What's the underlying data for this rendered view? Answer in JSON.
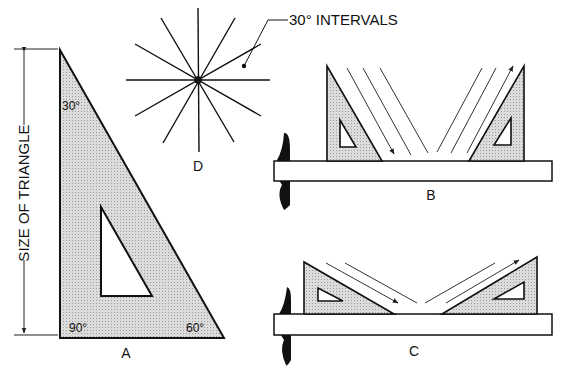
{
  "figure": {
    "labels": {
      "size_of_triangle": "SIZE OF TRIANGLE",
      "angle_30": "30°",
      "angle_90": "90°",
      "angle_60": "60°",
      "panel_a": "A",
      "panel_b": "B",
      "panel_c": "C",
      "panel_d": "D",
      "intervals": "30° INTERVALS"
    },
    "colors": {
      "ink": "#111111",
      "triangle_fill": "#d4d4d4",
      "background": "#ffffff"
    }
  }
}
